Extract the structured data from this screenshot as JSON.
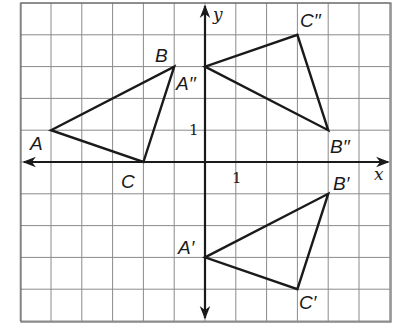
{
  "diagram": {
    "type": "coordinate-plane-transformations",
    "grid": {
      "x_range": [
        -6,
        6
      ],
      "y_range": [
        -5,
        5
      ],
      "origin_px": [
        205,
        162
      ],
      "unit_x_px": 30.8,
      "unit_y_px": 31.8,
      "line_color": "#8a8a8a"
    },
    "axes": {
      "x_label": "x",
      "y_label": "y",
      "x_tick_label": "1",
      "y_tick_label": "1",
      "color": "#1a1a1a"
    },
    "triangles": [
      {
        "name": "ABC",
        "vertices": [
          {
            "label": "A",
            "x": -5,
            "y": 1
          },
          {
            "label": "B",
            "x": -1,
            "y": 3
          },
          {
            "label": "C",
            "x": -2,
            "y": 0
          }
        ]
      },
      {
        "name": "A'B'C'",
        "vertices": [
          {
            "label": "A′",
            "x": 0,
            "y": -3
          },
          {
            "label": "B′",
            "x": 4,
            "y": -1
          },
          {
            "label": "C′",
            "x": 3,
            "y": -4
          }
        ]
      },
      {
        "name": "A''B''C''",
        "vertices": [
          {
            "label": "A′′",
            "x": 0,
            "y": 3
          },
          {
            "label": "B′′",
            "x": 4,
            "y": 1
          },
          {
            "label": "C′′",
            "x": 3,
            "y": 4
          }
        ]
      }
    ],
    "labels": {
      "A": "A",
      "B": "B",
      "C": "C",
      "A1": "A′",
      "B1": "B′",
      "C1": "C′",
      "A2": "A′′",
      "B2": "B′′",
      "C2": "C′′"
    }
  }
}
